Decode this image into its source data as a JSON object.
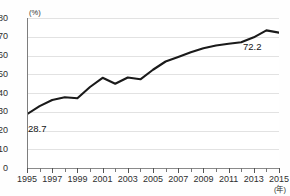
{
  "chart": {
    "title": "",
    "y_unit": "(%)",
    "x_unit": "(年)",
    "first_point_label": "28.7",
    "last_point_label": "72.2"
  },
  "chart_data": {
    "type": "line",
    "title": "",
    "xlabel": "(年)",
    "ylabel": "(%)",
    "xlim": [
      1995,
      2015
    ],
    "ylim": [
      0,
      80
    ],
    "ytick_values": [
      0,
      10,
      20,
      30,
      40,
      50,
      60,
      70,
      80
    ],
    "xtick_labels": [
      "1995",
      "1997",
      "1999",
      "2001",
      "2003",
      "2005",
      "2007",
      "2009",
      "2011",
      "2013",
      "2015"
    ],
    "xtick_label_years": [
      1995,
      1997,
      1999,
      2001,
      2003,
      2005,
      2007,
      2009,
      2011,
      2013,
      2015
    ],
    "grid": true,
    "legend": false,
    "line_color": "#1a1a1a",
    "x": [
      1995,
      1996,
      1997,
      1998,
      1999,
      2000,
      2001,
      2002,
      2003,
      2004,
      2005,
      2006,
      2007,
      2008,
      2009,
      2010,
      2011,
      2012,
      2013,
      2014,
      2015
    ],
    "values": [
      28.7,
      33.0,
      36.3,
      37.7,
      37.2,
      43.2,
      48.1,
      44.9,
      48.3,
      47.3,
      52.4,
      56.8,
      59.2,
      61.7,
      63.9,
      65.3,
      66.3,
      67.1,
      69.7,
      73.4,
      72.2
    ],
    "annotations": [
      {
        "x": 1995,
        "y": 28.7,
        "text": "28.7"
      },
      {
        "x": 2015,
        "y": 72.2,
        "text": "72.2"
      }
    ]
  }
}
